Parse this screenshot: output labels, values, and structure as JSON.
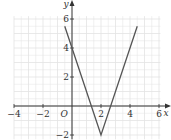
{
  "chart_data": {
    "type": "line",
    "title": "",
    "xlabel": "x",
    "ylabel": "y",
    "origin_label": "O",
    "xlim": [
      -4,
      6.1
    ],
    "ylim": [
      -2.3,
      6.2
    ],
    "x_ticks": [
      -4,
      -2,
      2,
      4,
      6
    ],
    "x_tick_labels": [
      "−4",
      "−2",
      "2",
      "4",
      "6"
    ],
    "y_ticks": [
      -2,
      2,
      4,
      6
    ],
    "y_tick_labels": [
      "−2",
      "2",
      "4",
      "6"
    ],
    "grid": true,
    "grid_minor_step": 0.5,
    "series": [
      {
        "name": "y = |3x − 6| − 2",
        "x": [
          -0.5,
          2,
          4.5
        ],
        "y": [
          5.5,
          -2,
          5.5
        ],
        "color": "#555555"
      }
    ],
    "colors": {
      "grid": "#e3e3e3",
      "axis": "#333333",
      "line": "#555555"
    }
  }
}
